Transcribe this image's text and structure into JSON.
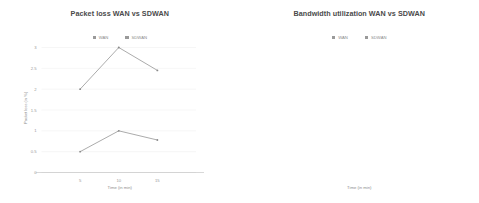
{
  "charts": [
    {
      "title": "Packet loss WAN vs SDWAN",
      "xlabel": "Time (in min)",
      "ylabel": "Packet loss (in %)",
      "legend": [
        {
          "label": "WAN",
          "color": "#9a9a9a"
        },
        {
          "label": "SDWAN",
          "color": "#9a9a9a"
        }
      ],
      "yticks": [
        "3",
        "2.5",
        "2",
        "1.5",
        "1",
        "0.5",
        "0"
      ],
      "xticks": [
        "5",
        "10",
        "15"
      ]
    },
    {
      "title": "Bandwidth utilization WAN vs SDWAN",
      "xlabel": "Time (in min)",
      "ylabel": "bandwidth utilization (in %)",
      "legend": [
        {
          "label": "WAN",
          "color": "#9a9a9a"
        },
        {
          "label": "SDWAN",
          "color": "#9a9a9a"
        }
      ],
      "yticks": [
        "100",
        "80",
        "60",
        "40",
        "20",
        "0"
      ],
      "xticks": [
        "5",
        "10",
        "15"
      ]
    }
  ],
  "chart_data": [
    {
      "type": "line",
      "title": "Packet loss WAN vs SDWAN",
      "xlabel": "Time (in min)",
      "ylabel": "Packet loss (in %)",
      "x": [
        5,
        10,
        15
      ],
      "categories": [
        "5",
        "10",
        "15"
      ],
      "series": [
        {
          "name": "WAN",
          "values": [
            2,
            3,
            2.45
          ],
          "color": "#8f8f8f"
        },
        {
          "name": "SDWAN",
          "values": [
            0.5,
            1,
            0.78
          ],
          "color": "#8f8f8f"
        }
      ],
      "xlim": [
        0,
        20
      ],
      "ylim": [
        0,
        3
      ],
      "ytick_values": [
        3,
        2.5,
        2,
        1.5,
        1,
        0.5,
        0
      ],
      "xtick_values": [
        5,
        10,
        15
      ],
      "grid": true,
      "legend_position": "top-center"
    },
    {
      "type": "line",
      "title": "Bandwidth utilization WAN vs SDWAN",
      "xlabel": "Time (in min)",
      "ylabel": "bandwidth utilization (in %)",
      "x": [
        5,
        10,
        15
      ],
      "categories": [
        "5",
        "10",
        "15"
      ],
      "series": [
        {
          "name": "WAN",
          "values": [
            60,
            64,
            57
          ],
          "color": "#8f8f8f"
        },
        {
          "name": "SDWAN",
          "values": [
            80,
            84,
            81
          ],
          "color": "#8f8f8f"
        }
      ],
      "xlim": [
        0,
        20
      ],
      "ylim": [
        0,
        100
      ],
      "ytick_values": [
        100,
        80,
        60,
        40,
        20,
        0
      ],
      "xtick_values": [
        5,
        10,
        15
      ],
      "grid": true,
      "legend_position": "top-center"
    }
  ]
}
